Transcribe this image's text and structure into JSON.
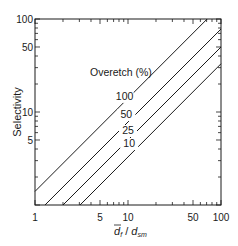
{
  "chart_data": {
    "type": "line",
    "title": "",
    "xlabel": "d̄f / dsm",
    "xlabel_parts": {
      "main": "d",
      "overbar": true,
      "sub1": "f",
      "sep": " / ",
      "main2": "d",
      "sub2": "sm"
    },
    "ylabel": "Selectivity",
    "xscale": "log",
    "yscale": "log",
    "xlim": [
      1,
      100
    ],
    "ylim": [
      1,
      100
    ],
    "grid": false,
    "x_ticks": [
      1,
      5,
      10,
      50,
      100
    ],
    "x_tick_labels": [
      "1",
      "5",
      "10",
      "50",
      "100"
    ],
    "y_ticks": [
      5,
      10,
      50,
      100
    ],
    "y_tick_labels": [
      "5",
      "10",
      "50",
      "100"
    ],
    "legend_title": "Overetch (%)",
    "series": [
      {
        "name": "100",
        "x": [
          1,
          71
        ],
        "y": [
          1.4,
          100
        ]
      },
      {
        "name": "50",
        "x": [
          1.28,
          100
        ],
        "y": [
          1,
          78
        ]
      },
      {
        "name": "25",
        "x": [
          2.0,
          100
        ],
        "y": [
          1,
          50
        ]
      },
      {
        "name": "10",
        "x": [
          3.05,
          100
        ],
        "y": [
          1,
          33
        ]
      }
    ],
    "series_label_positions": [
      {
        "name": "100",
        "x": 9.2,
        "y": 13.5
      },
      {
        "name": "50",
        "x": 9.6,
        "y": 8.6
      },
      {
        "name": "25",
        "x": 10.0,
        "y": 5.8
      },
      {
        "name": "10",
        "x": 10.3,
        "y": 4.2
      }
    ]
  }
}
